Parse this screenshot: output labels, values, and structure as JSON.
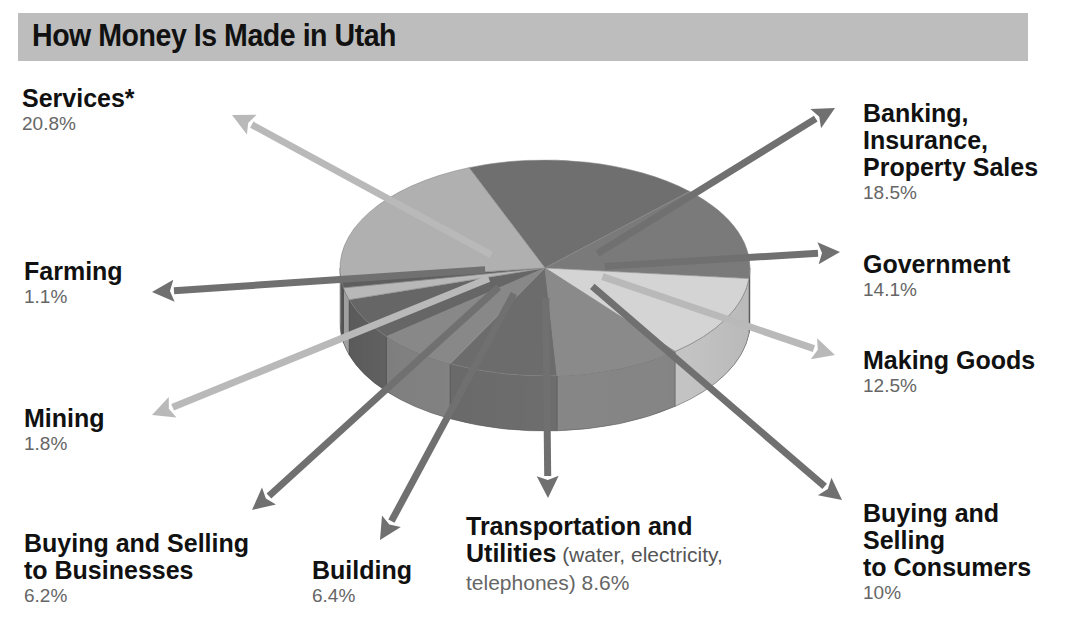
{
  "chart_data": {
    "type": "pie",
    "title": "How Money Is Made in Utah",
    "slices": [
      {
        "label": "Banking, Insurance, Property Sales",
        "value": 18.5,
        "pct_text": "18.5%",
        "color": "#6f6f6f"
      },
      {
        "label": "Government",
        "value": 14.1,
        "pct_text": "14.1%",
        "color": "#7a7a7a"
      },
      {
        "label": "Making Goods",
        "value": 12.5,
        "pct_text": "12.5%",
        "color": "#d4d4d4"
      },
      {
        "label": "Buying and Selling to Consumers",
        "value": 10,
        "pct_text": "10%",
        "color": "#8a8a8a"
      },
      {
        "label": "Transportation and Utilities",
        "note": "(water, electricity, telephones)",
        "value": 8.6,
        "pct_text": "8.6%",
        "color": "#6c6c6c"
      },
      {
        "label": "Building",
        "value": 6.4,
        "pct_text": "6.4%",
        "color": "#888888"
      },
      {
        "label": "Buying and Selling to Businesses",
        "value": 6.2,
        "pct_text": "6.2%",
        "color": "#666666"
      },
      {
        "label": "Mining",
        "value": 1.8,
        "pct_text": "1.8%",
        "color": "#b8b8b8"
      },
      {
        "label": "Farming",
        "value": 1.1,
        "pct_text": "1.1%",
        "color": "#5e5e5e"
      },
      {
        "label": "Services*",
        "value": 20.8,
        "pct_text": "20.8%",
        "color": "#b0b0b0"
      }
    ]
  },
  "labels": {
    "services": {
      "name": "Services*",
      "pct": "20.8%"
    },
    "farming": {
      "name": "Farming",
      "pct": "1.1%"
    },
    "mining": {
      "name": "Mining",
      "pct": "1.8%"
    },
    "businesses": {
      "name": "Buying and Selling\nto Businesses",
      "pct": "6.2%"
    },
    "building": {
      "name": "Building",
      "pct": "6.4%"
    },
    "transport": {
      "name": "Transportation and\nUtilities",
      "note": " (water, electricity,",
      "pct": "telephones) 8.6%"
    },
    "consumers": {
      "name": "Buying and\nSelling\nto Consumers",
      "pct": "10%"
    },
    "making": {
      "name": "Making Goods",
      "pct": "12.5%"
    },
    "government": {
      "name": "Government",
      "pct": "14.1%"
    },
    "banking": {
      "name": "Banking,\nInsurance,\nProperty Sales",
      "pct": "18.5%"
    }
  }
}
